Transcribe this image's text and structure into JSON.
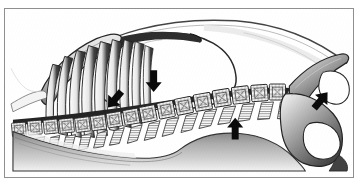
{
  "figure": {
    "style": "black-and-white-line-engraving",
    "frame": {
      "border_color": "#8f8f8f",
      "background_color": "#ffffff",
      "border_width_px": 1,
      "x": 4,
      "y": 8,
      "width": 350,
      "height": 170
    },
    "ink_color": "#1a1a1a",
    "arrow_color": "#000000",
    "structures": [
      {
        "name": "scapula",
        "label": "scapula"
      },
      {
        "name": "rib-cage",
        "label": "ribs"
      },
      {
        "name": "thoracic-cavity",
        "label": "thoracic cavity"
      },
      {
        "name": "thoracic-vertebrae",
        "label": "thoracic vertebrae"
      },
      {
        "name": "lumbar-vertebrae",
        "label": "lumbar vertebrae"
      },
      {
        "name": "sacrum",
        "label": "sacrum"
      },
      {
        "name": "pelvis-ilium",
        "label": "ilium"
      },
      {
        "name": "obturator-foramen",
        "label": "obturator foramen"
      },
      {
        "name": "sternum",
        "label": "sternum"
      },
      {
        "name": "dorsal-body-contour",
        "label": "dorsal body contour"
      },
      {
        "name": "ventral-body-contour",
        "label": "ventral body contour"
      }
    ],
    "arrows": [
      {
        "name": "arrow-thoracolumbar-junction",
        "direction": "down",
        "x": 149,
        "y": 81,
        "length": 22,
        "head": 10,
        "shaft": 5
      },
      {
        "name": "arrow-caudal-thorax",
        "direction": "down-right",
        "x": 113,
        "y": 100,
        "length": 20,
        "head": 10,
        "shaft": 5
      },
      {
        "name": "arrow-lumbosacral-ventral",
        "direction": "up",
        "x": 231,
        "y": 122,
        "length": 20,
        "head": 10,
        "shaft": 5
      },
      {
        "name": "arrow-pelvic-inlet",
        "direction": "down-left",
        "x": 320,
        "y": 98,
        "length": 20,
        "head": 10,
        "shaft": 5
      }
    ],
    "counts": {
      "ribs_drawn": 9,
      "vertebrae_drawn": 20,
      "arrows": 4
    }
  }
}
